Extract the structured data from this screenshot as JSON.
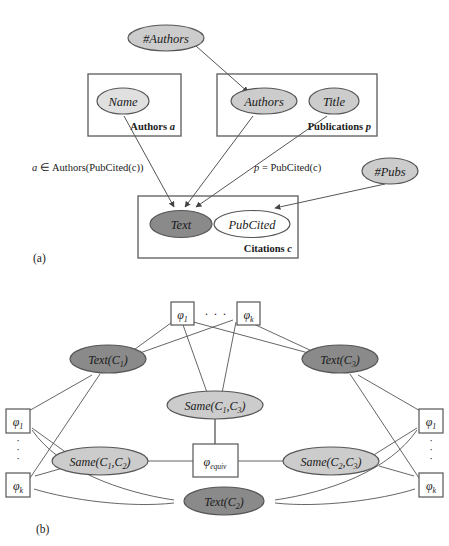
{
  "figure": {
    "panels": [
      {
        "id": "a",
        "label": "(a)",
        "plates": [
          {
            "name": "authors-plate",
            "label_text": "Authors ",
            "label_var": "a"
          },
          {
            "name": "publications-plate",
            "label_text": "Publications ",
            "label_var": "p"
          },
          {
            "name": "citations-plate",
            "label_text": "Citations ",
            "label_var": "c"
          }
        ],
        "nodes": [
          {
            "name": "num-authors-node",
            "label": "#Authors",
            "shade": "light"
          },
          {
            "name": "name-node",
            "label": "Name",
            "shade": "light"
          },
          {
            "name": "authors-node",
            "label": "Authors",
            "shade": "light"
          },
          {
            "name": "title-node",
            "label": "Title",
            "shade": "light"
          },
          {
            "name": "num-pubs-node",
            "label": "#Pubs",
            "shade": "light"
          },
          {
            "name": "text-node",
            "label": "Text",
            "shade": "dark"
          },
          {
            "name": "pubcited-node",
            "label": "PubCited",
            "shade": "white"
          }
        ],
        "edge_labels": [
          {
            "name": "authors-membership-label",
            "var": "a",
            "rest": " ∈ Authors(PubCited(c))"
          },
          {
            "name": "pubcited-equality-label",
            "var": "p",
            "rest": " = PubCited(c)"
          }
        ]
      },
      {
        "id": "b",
        "label": "(b)",
        "factors": [
          {
            "name": "factor-top-phi1",
            "sub": "1"
          },
          {
            "name": "factor-top-phik",
            "sub": "k"
          },
          {
            "name": "factor-left-phi1",
            "sub": "1"
          },
          {
            "name": "factor-left-phik",
            "sub": "k"
          },
          {
            "name": "factor-right-phi1",
            "sub": "1"
          },
          {
            "name": "factor-right-phik",
            "sub": "k"
          },
          {
            "name": "factor-equiv",
            "sub": "equiv"
          }
        ],
        "ellipsis_top": "· · ·",
        "ellipsis_vertical": "·",
        "nodes": [
          {
            "name": "text-c1-node",
            "fn": "Text",
            "arg": "(C",
            "sub": "1",
            "close": ")",
            "shade": "dark"
          },
          {
            "name": "text-c3-node",
            "fn": "Text",
            "arg": "(C",
            "sub": "3",
            "close": ")",
            "shade": "dark"
          },
          {
            "name": "text-c2-node",
            "fn": "Text",
            "arg": "(C",
            "sub": "2",
            "close": ")",
            "shade": "dark"
          },
          {
            "name": "same-c1-c3-node",
            "fn": "Same",
            "arg": "(C",
            "sub": "1",
            "sub2": "3",
            "close": ")",
            "shade": "light"
          },
          {
            "name": "same-c1-c2-node",
            "fn": "Same",
            "arg": "(C",
            "sub": "1",
            "sub2": "2",
            "close": ")",
            "shade": "light"
          },
          {
            "name": "same-c2-c3-node",
            "fn": "Same",
            "arg": "(C",
            "sub": "2",
            "sub2": "3",
            "close": ")",
            "shade": "light"
          }
        ]
      }
    ]
  },
  "colors": {
    "dark_fill": "#8a8a8a",
    "light_fill": "#cccccc",
    "white_fill": "#ffffff",
    "stroke": "#555555",
    "text": "#1a1a1a"
  }
}
